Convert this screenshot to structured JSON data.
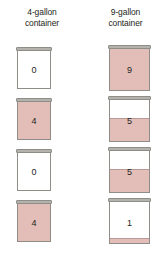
{
  "columns": [
    {
      "id": "left",
      "line1": "4-gallon",
      "line2": "container",
      "capacity": 4
    },
    {
      "id": "right",
      "line1": "9-gallon",
      "line2": "container",
      "capacity": 9
    }
  ],
  "colors": {
    "water": "#e3bdb8",
    "rim": "#b3b2ad",
    "outline": "#8e8d88",
    "empty": "#ffffff",
    "text": "#231f20"
  },
  "steps": [
    {
      "index": 0,
      "left": {
        "amount": "0",
        "capacity": 4,
        "fill_fraction": 0
      },
      "right": {
        "amount": "9",
        "capacity": 9,
        "fill_fraction": 1
      }
    },
    {
      "index": 1,
      "left": {
        "amount": "4",
        "capacity": 4,
        "fill_fraction": 1
      },
      "right": {
        "amount": "5",
        "capacity": 9,
        "fill_fraction": 0.5555
      }
    },
    {
      "index": 2,
      "left": {
        "amount": "0",
        "capacity": 4,
        "fill_fraction": 0
      },
      "right": {
        "amount": "5",
        "capacity": 9,
        "fill_fraction": 0.5555
      }
    },
    {
      "index": 3,
      "left": {
        "amount": "4",
        "capacity": 4,
        "fill_fraction": 1
      },
      "right": {
        "amount": "1",
        "capacity": 9,
        "fill_fraction": 0.1111
      }
    }
  ]
}
